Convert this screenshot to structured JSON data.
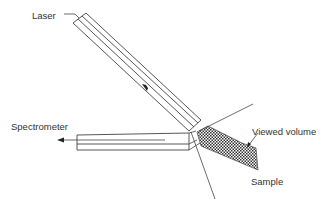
{
  "diagram": {
    "type": "Raman backscattering probe geometry",
    "labels": {
      "laser": "Laser",
      "spectrometer": "Spectrometer",
      "viewed_volume": "Viewed volume",
      "sample": "Sample"
    },
    "colors": {
      "line": "#444444",
      "text": "#333333",
      "sample_fill": "#555555",
      "background": "#ffffff"
    },
    "components": [
      {
        "name": "laser",
        "shape": "tube",
        "orientation": "diagonal down-right",
        "arrow": "toward sample"
      },
      {
        "name": "spectrometer",
        "shape": "tube",
        "orientation": "horizontal",
        "arrow": "toward left"
      },
      {
        "name": "viewed-volume",
        "shape": "dotted wedge",
        "pattern": "checker-stipple"
      },
      {
        "name": "sample-boundary-lines",
        "shape": "two lines diverging from focal point"
      }
    ]
  }
}
